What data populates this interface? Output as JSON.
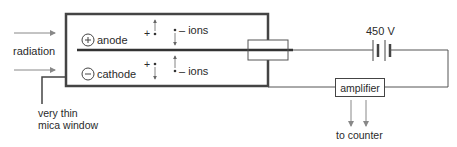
{
  "diagram": {
    "type": "geiger-muller-tube-circuit",
    "labels": {
      "radiation": "radiation",
      "anode": "anode",
      "cathode": "cathode",
      "anode_sign": "+",
      "cathode_sign": "−",
      "positive_ion_top": "+",
      "positive_ion_bottom": "+",
      "negative_ions_top": "– ions",
      "negative_ions_bottom": "– ions",
      "window_line1": "very thin",
      "window_line2": "mica window",
      "voltage": "450 V",
      "amplifier": "amplifier",
      "to_counter": "to counter"
    },
    "colors": {
      "line": "#444444",
      "thick_line": "#333333",
      "arrow": "#888888",
      "text": "#2a2a2a"
    }
  }
}
